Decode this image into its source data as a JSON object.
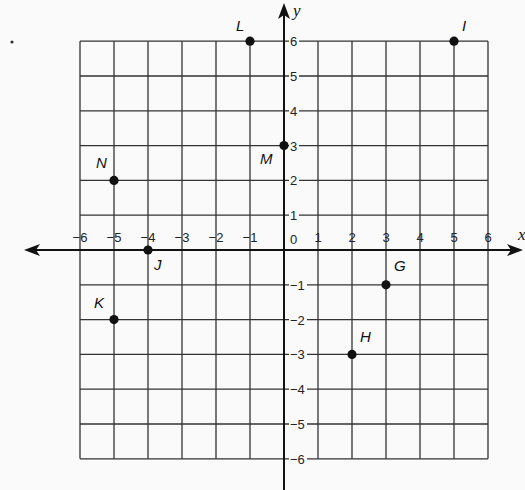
{
  "chart_data": {
    "type": "scatter",
    "title": "",
    "xlabel": "x",
    "ylabel": "y",
    "xlim": [
      -6,
      6
    ],
    "ylim": [
      -6,
      6
    ],
    "grid": true,
    "x_ticks": [
      -6,
      -5,
      -4,
      -3,
      -2,
      -1,
      0,
      1,
      2,
      3,
      4,
      5,
      6
    ],
    "y_ticks": [
      -6,
      -5,
      -4,
      -3,
      -2,
      -1,
      1,
      2,
      3,
      4,
      5,
      6
    ],
    "origin_label": "0",
    "points": [
      {
        "label": "G",
        "x": 3,
        "y": -1
      },
      {
        "label": "H",
        "x": 2,
        "y": -3
      },
      {
        "label": "I",
        "x": 5,
        "y": 6
      },
      {
        "label": "J",
        "x": -4,
        "y": 0
      },
      {
        "label": "K",
        "x": -5,
        "y": -2
      },
      {
        "label": "L",
        "x": -1,
        "y": 6
      },
      {
        "label": "M",
        "x": 0,
        "y": 3
      },
      {
        "label": "N",
        "x": -5,
        "y": 2
      }
    ]
  },
  "colors": {
    "grid": "#333333",
    "axis": "#111111",
    "point": "#111111",
    "background": "#fafafa"
  }
}
